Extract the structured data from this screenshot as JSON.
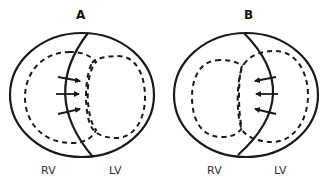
{
  "panels": [
    {
      "id": "A",
      "title": "A",
      "labels": {
        "left": "RV",
        "right": "LV"
      },
      "arrow_direction": "right",
      "arrow_count": 3
    },
    {
      "id": "B",
      "title": "B",
      "labels": {
        "left": "RV",
        "right": "LV"
      },
      "arrow_direction": "left",
      "arrow_count": 3
    }
  ],
  "colors": {
    "stroke": "#1a1a1a",
    "text": "#333333",
    "background": "#ffffff"
  }
}
